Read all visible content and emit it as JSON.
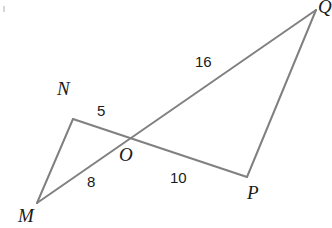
{
  "figure": {
    "type": "geometry-diagram",
    "width": 332,
    "height": 228,
    "background_color": "#ffffff",
    "stroke_color": "#808080",
    "stroke_width": 2,
    "text_color": "#1a1a1a"
  },
  "vertices": [
    {
      "id": "M",
      "label": "M",
      "x": 37,
      "y": 203,
      "label_x": 18,
      "label_y": 206
    },
    {
      "id": "N",
      "label": "N",
      "x": 73,
      "y": 119,
      "label_x": 57,
      "label_y": 79
    },
    {
      "id": "O",
      "label": "O",
      "x": 130,
      "y": 137,
      "label_x": 119,
      "label_y": 145
    },
    {
      "id": "P",
      "label": "P",
      "x": 247,
      "y": 177,
      "label_x": 247,
      "label_y": 183
    },
    {
      "id": "Q",
      "label": "Q",
      "x": 316,
      "y": 10,
      "label_x": 318,
      "label_y": -3
    }
  ],
  "segments": [
    {
      "id": "MN",
      "from": "M",
      "to": "N"
    },
    {
      "id": "NP",
      "from": "N",
      "to": "P",
      "through": "O"
    },
    {
      "id": "MQ",
      "from": "M",
      "to": "Q",
      "through": "O"
    },
    {
      "id": "PQ",
      "from": "P",
      "to": "Q"
    }
  ],
  "measures": [
    {
      "id": "NO",
      "segment": "N-O",
      "value": "5",
      "x": 97,
      "y": 103
    },
    {
      "id": "MO",
      "segment": "M-O",
      "value": "8",
      "x": 87,
      "y": 174
    },
    {
      "id": "OP",
      "segment": "O-P",
      "value": "10",
      "x": 170,
      "y": 170
    },
    {
      "id": "OQ",
      "segment": "O-Q",
      "value": "16",
      "x": 195,
      "y": 54
    }
  ],
  "chart_data": {
    "type": "diagram",
    "title": "",
    "points": {
      "M": [
        37,
        203
      ],
      "N": [
        73,
        119
      ],
      "O": [
        130,
        137
      ],
      "P": [
        247,
        177
      ],
      "Q": [
        316,
        10
      ]
    },
    "edges": [
      [
        "M",
        "N"
      ],
      [
        "N",
        "P"
      ],
      [
        "M",
        "Q"
      ],
      [
        "P",
        "Q"
      ]
    ],
    "edge_labels": {
      "N-O": 5,
      "M-O": 8,
      "O-P": 10,
      "O-Q": 16
    }
  }
}
